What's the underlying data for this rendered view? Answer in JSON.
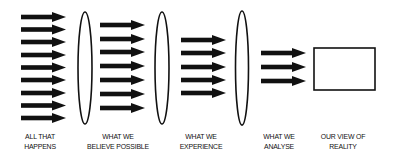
{
  "diagram": {
    "colors": {
      "arrow": "#111111",
      "stroke": "#111111",
      "background": "#ffffff"
    },
    "stages": [
      {
        "line1": "ALL THAT",
        "line2": "HAPPENS",
        "arrow_count": 9
      },
      {
        "line1": "WHAT WE",
        "line2": "BELIEVE POSSIBLE",
        "arrow_count": 7
      },
      {
        "line1": "WHAT WE",
        "line2": "EXPERIENCE",
        "arrow_count": 5
      },
      {
        "line1": "WHAT WE",
        "line2": "ANALYSE",
        "arrow_count": 3
      },
      {
        "line1": "OUR VIEW OF",
        "line2": "REALITY",
        "arrow_count": 0
      }
    ],
    "filters": [
      "lens-1",
      "lens-2",
      "lens-3"
    ],
    "result": "box"
  }
}
